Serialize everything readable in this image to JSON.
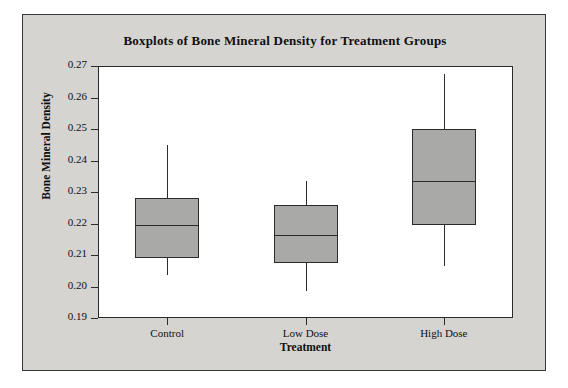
{
  "chart_data": {
    "type": "box",
    "title": "Boxplots of Bone Mineral Density for Treatment Groups",
    "xlabel": "Treatment",
    "ylabel": "Bone Mineral Density",
    "categories": [
      "Control",
      "Low Dose",
      "High Dose"
    ],
    "ylim": [
      0.19,
      0.27
    ],
    "ytick_labels": [
      "0.27",
      "0.26",
      "0.25",
      "0.24",
      "0.23",
      "0.22",
      "0.21",
      "0.20",
      "0.19"
    ],
    "ytick_values": [
      0.27,
      0.26,
      0.25,
      0.24,
      0.23,
      0.22,
      0.21,
      0.2,
      0.19
    ],
    "grid": false,
    "legend": "none",
    "boxes": [
      {
        "label": "Control",
        "whisker_low": 0.2035,
        "q1": 0.209,
        "median": 0.2195,
        "q3": 0.228,
        "whisker_high": 0.245
      },
      {
        "label": "Low Dose",
        "whisker_low": 0.1987,
        "q1": 0.2075,
        "median": 0.2165,
        "q3": 0.2258,
        "whisker_high": 0.2334
      },
      {
        "label": "High Dose",
        "whisker_low": 0.2065,
        "q1": 0.2195,
        "median": 0.2334,
        "q3": 0.25,
        "whisker_high": 0.2675
      }
    ],
    "box_fill_color": "#a9a9a7",
    "box_line_color": "#2b2b2b",
    "plot_background": "#ffffff",
    "figure_background": "#d5d4d0"
  }
}
